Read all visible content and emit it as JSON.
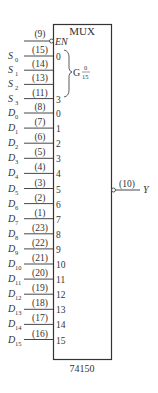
{
  "chip": {
    "title": "MUX",
    "part_number": "74150",
    "enable": {
      "label": "EN",
      "pin": "(9)",
      "active_low": true
    },
    "select_group": {
      "label": "G",
      "range_top": "0",
      "range_bottom": "15"
    },
    "output": {
      "label": "Y",
      "pin": "(10)",
      "inverted": true
    }
  },
  "select_inputs": [
    {
      "name": "S",
      "sub": "0",
      "pin": "(15)",
      "inner": "0"
    },
    {
      "name": "S",
      "sub": "1",
      "pin": "(14)",
      "inner": ""
    },
    {
      "name": "S",
      "sub": "2",
      "pin": "(13)",
      "inner": ""
    },
    {
      "name": "S",
      "sub": "3",
      "pin": "(11)",
      "inner": "3"
    }
  ],
  "data_inputs": [
    {
      "name": "D",
      "sub": "0",
      "pin": "(8)",
      "inner": "0"
    },
    {
      "name": "D",
      "sub": "1",
      "pin": "(7)",
      "inner": "1"
    },
    {
      "name": "D",
      "sub": "2",
      "pin": "(6)",
      "inner": "2"
    },
    {
      "name": "D",
      "sub": "3",
      "pin": "(5)",
      "inner": "3"
    },
    {
      "name": "D",
      "sub": "4",
      "pin": "(4)",
      "inner": "4"
    },
    {
      "name": "D",
      "sub": "5",
      "pin": "(3)",
      "inner": "5"
    },
    {
      "name": "D",
      "sub": "6",
      "pin": "(2)",
      "inner": "6"
    },
    {
      "name": "D",
      "sub": "7",
      "pin": "(1)",
      "inner": "7"
    },
    {
      "name": "D",
      "sub": "8",
      "pin": "(23)",
      "inner": "8"
    },
    {
      "name": "D",
      "sub": "9",
      "pin": "(22)",
      "inner": "9"
    },
    {
      "name": "D",
      "sub": "10",
      "pin": "(21)",
      "inner": "10"
    },
    {
      "name": "D",
      "sub": "11",
      "pin": "(20)",
      "inner": "11"
    },
    {
      "name": "D",
      "sub": "12",
      "pin": "(19)",
      "inner": "12"
    },
    {
      "name": "D",
      "sub": "13",
      "pin": "(18)",
      "inner": "13"
    },
    {
      "name": "D",
      "sub": "14",
      "pin": "(17)",
      "inner": "14"
    },
    {
      "name": "D",
      "sub": "15",
      "pin": "(16)",
      "inner": "15"
    }
  ]
}
